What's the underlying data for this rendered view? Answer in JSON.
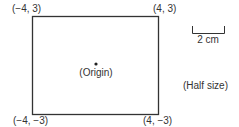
{
  "figure": {
    "corners": {
      "top_left": "(−4, 3)",
      "top_right": "(4, 3)",
      "bottom_left": "(−4, −3)",
      "bottom_right": "(4, −3)"
    },
    "origin_label": "(Origin)",
    "scale_bar_label": "2 cm",
    "size_note": "(Half size)"
  }
}
